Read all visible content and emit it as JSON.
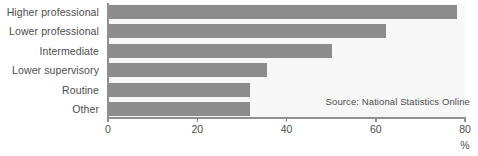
{
  "chart_data": {
    "type": "bar",
    "orientation": "horizontal",
    "title": "",
    "xlabel": "%",
    "ylabel": "",
    "categories": [
      "Higher professional",
      "Lower professional",
      "Intermediate",
      "Lower supervisory",
      "Routine",
      "Other"
    ],
    "values": [
      78,
      62,
      50,
      35.5,
      31.5,
      31.5
    ],
    "xlim": [
      0,
      80
    ],
    "xticks": [
      0,
      20,
      40,
      60,
      80
    ],
    "xtick_labels": [
      "0",
      "20",
      "40",
      "60",
      "80"
    ],
    "grid": false,
    "legend": false,
    "annotations": [
      {
        "text": "Source: National Statistics Online",
        "position": "bottom-right-inside-plot"
      }
    ],
    "colors": {
      "bar": "#8c8c8c",
      "plot_background": "#f7f7f7",
      "axis": "#8f8f8f",
      "text": "#4d4d4d",
      "page_background": "#ffffff"
    }
  },
  "axis": {
    "unit_label": "%"
  },
  "source": {
    "text": "Source: National Statistics Online"
  }
}
